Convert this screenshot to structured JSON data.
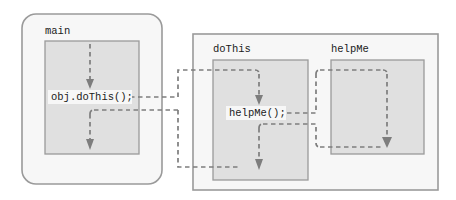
{
  "diagram": {
    "type": "method-call-flow-diagram",
    "background_color": "#ffffff",
    "frame_fill": "#f7f7f7",
    "body_fill": "#e0e0e0",
    "border_color": "#9a9a9a",
    "flow_color": "#7d7d7d",
    "text_color": "#1b1b1b",
    "frames": [
      {
        "id": "main-frame",
        "title": "main",
        "shape": "rounded-rect",
        "x": 22,
        "y": 14,
        "width": 140,
        "height": 170,
        "body": {
          "x": 45,
          "y": 41,
          "width": 94,
          "height": 113
        }
      },
      {
        "id": "object-frame",
        "title": "",
        "shape": "rect",
        "x": 193,
        "y": 34,
        "width": 245,
        "height": 156,
        "body": null
      },
      {
        "id": "dothis-frame",
        "title": "doThis",
        "shape": "rect",
        "x": 193,
        "y": 34,
        "width": 245,
        "height": 156,
        "body": {
          "x": 213,
          "y": 60,
          "width": 95,
          "height": 120
        }
      },
      {
        "id": "helpme-frame",
        "title": "helpMe",
        "shape": "rect",
        "x": 331,
        "y": 60,
        "width": 93,
        "height": 94,
        "body": {
          "x": 331,
          "y": 60,
          "width": 93,
          "height": 94
        }
      }
    ],
    "statements": [
      {
        "id": "call-dothis",
        "text": "obj.doThis();",
        "x": 51,
        "y": 97
      },
      {
        "id": "call-helpme",
        "text": "helpMe();",
        "x": 229,
        "y": 113
      }
    ],
    "flow_arrows": [
      {
        "id": "main-entry-arrow",
        "description": "entry into main body, arrow down to obj.doThis();"
      },
      {
        "id": "call-out-to-dothis",
        "description": "dashed call from obj.doThis(); across to doThis body"
      },
      {
        "id": "dothis-entry-arrow",
        "description": "arrow down inside doThis to helpMe();"
      },
      {
        "id": "call-out-to-helpme",
        "description": "dashed call from helpMe(); across to helpMe body"
      },
      {
        "id": "helpme-entry-arrow",
        "description": "arrow down inside helpMe body"
      },
      {
        "id": "return-helpme-to-dothis",
        "description": "dashed return from helpMe bottom back to doThis, arrow down"
      },
      {
        "id": "return-dothis-to-main",
        "description": "dashed return from doThis bottom back to main, arrow down"
      }
    ]
  }
}
